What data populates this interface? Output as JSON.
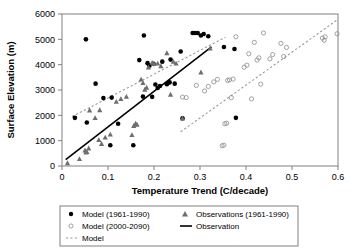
{
  "chart_data": {
    "type": "scatter",
    "title": "",
    "xlabel": "Temperature Trend (C/decade)",
    "ylabel": "Surface Elevation (m)",
    "xlim": [
      0,
      0.6
    ],
    "ylim": [
      0,
      6000
    ],
    "xticks": [
      "0",
      "0.1",
      "0.2",
      "0.3",
      "0.4",
      "0.5",
      "0.6"
    ],
    "xtick_values": [
      0,
      0.1,
      0.2,
      0.3,
      0.4,
      0.5,
      0.6
    ],
    "yticks": [
      "0",
      "1000",
      "2000",
      "3000",
      "4000",
      "5000",
      "6000"
    ],
    "ytick_values": [
      0,
      1000,
      2000,
      3000,
      4000,
      5000,
      6000
    ],
    "grid": false,
    "legend_position": "below-plot",
    "series": [
      {
        "name": "Model (1961-1990)",
        "marker": "filled-circle",
        "color": "#000000",
        "points": [
          [
            0.028,
            1900
          ],
          [
            0.052,
            5000
          ],
          [
            0.054,
            1720
          ],
          [
            0.073,
            3250
          ],
          [
            0.09,
            2680
          ],
          [
            0.105,
            820
          ],
          [
            0.108,
            2700
          ],
          [
            0.122,
            1670
          ],
          [
            0.155,
            820
          ],
          [
            0.168,
            4180
          ],
          [
            0.176,
            2740
          ],
          [
            0.178,
            5150
          ],
          [
            0.186,
            4060
          ],
          [
            0.19,
            3960
          ],
          [
            0.196,
            2730
          ],
          [
            0.199,
            4030
          ],
          [
            0.203,
            3220
          ],
          [
            0.208,
            3080
          ],
          [
            0.213,
            3160
          ],
          [
            0.218,
            4120
          ],
          [
            0.228,
            3230
          ],
          [
            0.234,
            3300
          ],
          [
            0.236,
            4200
          ],
          [
            0.245,
            3250
          ],
          [
            0.258,
            4520
          ],
          [
            0.262,
            1880
          ],
          [
            0.284,
            5250
          ],
          [
            0.289,
            5250
          ],
          [
            0.295,
            5250
          ],
          [
            0.302,
            5150
          ],
          [
            0.308,
            5210
          ],
          [
            0.318,
            5120
          ],
          [
            0.352,
            4700
          ],
          [
            0.375,
            4620
          ],
          [
            0.378,
            1900
          ]
        ]
      },
      {
        "name": "Model (2000-2090)",
        "marker": "open-circle",
        "color": "#8c8c8c",
        "points": [
          [
            0.262,
            2720
          ],
          [
            0.27,
            2700
          ],
          [
            0.292,
            3180
          ],
          [
            0.31,
            2960
          ],
          [
            0.318,
            3140
          ],
          [
            0.33,
            3320
          ],
          [
            0.338,
            3420
          ],
          [
            0.348,
            800
          ],
          [
            0.352,
            820
          ],
          [
            0.354,
            1670
          ],
          [
            0.358,
            1690
          ],
          [
            0.36,
            3380
          ],
          [
            0.364,
            3400
          ],
          [
            0.368,
            2700
          ],
          [
            0.372,
            3430
          ],
          [
            0.378,
            5100
          ],
          [
            0.396,
            3900
          ],
          [
            0.402,
            3980
          ],
          [
            0.406,
            4430
          ],
          [
            0.412,
            2650
          ],
          [
            0.418,
            4880
          ],
          [
            0.424,
            4180
          ],
          [
            0.428,
            4270
          ],
          [
            0.432,
            3230
          ],
          [
            0.438,
            5250
          ],
          [
            0.452,
            4230
          ],
          [
            0.458,
            4400
          ],
          [
            0.476,
            4840
          ],
          [
            0.482,
            4320
          ],
          [
            0.488,
            4680
          ],
          [
            0.566,
            5050
          ],
          [
            0.57,
            4960
          ],
          [
            0.572,
            5100
          ],
          [
            0.598,
            5220
          ]
        ]
      },
      {
        "name": "Observations (1961-1990)",
        "marker": "triangle",
        "color": "#6e6e6e",
        "points": [
          [
            0.012,
            120
          ],
          [
            0.038,
            280
          ],
          [
            0.05,
            620
          ],
          [
            0.052,
            540
          ],
          [
            0.054,
            560
          ],
          [
            0.058,
            700
          ],
          [
            0.06,
            2200
          ],
          [
            0.072,
            1900
          ],
          [
            0.08,
            1030
          ],
          [
            0.082,
            2210
          ],
          [
            0.086,
            880
          ],
          [
            0.094,
            1130
          ],
          [
            0.105,
            1250
          ],
          [
            0.118,
            2540
          ],
          [
            0.128,
            2650
          ],
          [
            0.14,
            2740
          ],
          [
            0.152,
            1230
          ],
          [
            0.156,
            1590
          ],
          [
            0.16,
            1680
          ],
          [
            0.163,
            1640
          ],
          [
            0.172,
            3420
          ],
          [
            0.176,
            3280
          ],
          [
            0.18,
            3020
          ],
          [
            0.184,
            3100
          ],
          [
            0.188,
            3900
          ],
          [
            0.196,
            4080
          ],
          [
            0.2,
            4030
          ],
          [
            0.208,
            4050
          ],
          [
            0.215,
            3950
          ],
          [
            0.228,
            4460
          ],
          [
            0.236,
            2820
          ],
          [
            0.242,
            4120
          ],
          [
            0.248,
            4050
          ],
          [
            0.262,
            1880
          ],
          [
            0.302,
            3700
          ],
          [
            0.322,
            4650
          ]
        ]
      }
    ],
    "lines": [
      {
        "name": "Observation",
        "style": "solid",
        "color": "#000000",
        "x": [
          0.008,
          0.325
        ],
        "y": [
          250,
          4700
        ]
      },
      {
        "name": "Model",
        "style": "dotted",
        "color": "#9a9a9a",
        "segments": [
          {
            "x": [
              0.022,
              0.355
            ],
            "y": [
              1950,
              5080
            ]
          },
          {
            "x": [
              0.258,
              0.6
            ],
            "y": [
              1350,
              5790
            ]
          }
        ]
      }
    ]
  },
  "legend": {
    "entries": [
      {
        "label": "Model (1961-1990)",
        "marker": "filled-circle"
      },
      {
        "label": "Observations (1961-1990)",
        "marker": "triangle"
      },
      {
        "label": "Model (2000-2090)",
        "marker": "open-circle"
      },
      {
        "label": "Observation",
        "marker": "solid-line"
      },
      {
        "label": "Model",
        "marker": "dotted-line"
      }
    ]
  }
}
